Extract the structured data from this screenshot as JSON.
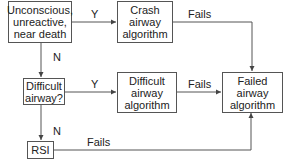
{
  "diagram": {
    "type": "flowchart",
    "nodes": [
      {
        "id": "unconscious",
        "lines": [
          "Unconscious,",
          "unreactive,",
          "near death"
        ]
      },
      {
        "id": "crash",
        "lines": [
          "Crash",
          "airway",
          "algorithm"
        ]
      },
      {
        "id": "difficult_q",
        "lines": [
          "Difficult",
          "airway?"
        ]
      },
      {
        "id": "difficult_alg",
        "lines": [
          "Difficult",
          "airway",
          "algorithm"
        ]
      },
      {
        "id": "failed",
        "lines": [
          "Failed",
          "airway",
          "algorithm"
        ]
      },
      {
        "id": "rsi",
        "lines": [
          "RSI"
        ]
      }
    ],
    "edges": [
      {
        "from": "unconscious",
        "to": "crash",
        "label": "Y"
      },
      {
        "from": "unconscious",
        "to": "difficult_q",
        "label": "N"
      },
      {
        "from": "crash",
        "to": "failed",
        "label": "Fails"
      },
      {
        "from": "difficult_q",
        "to": "difficult_alg",
        "label": "Y"
      },
      {
        "from": "difficult_q",
        "to": "rsi",
        "label": "N"
      },
      {
        "from": "difficult_alg",
        "to": "failed",
        "label": "Fails"
      },
      {
        "from": "rsi",
        "to": "failed",
        "label": "Fails"
      }
    ],
    "colors": {
      "line": "#555555",
      "text": "#222222",
      "background": "#ffffff"
    }
  }
}
